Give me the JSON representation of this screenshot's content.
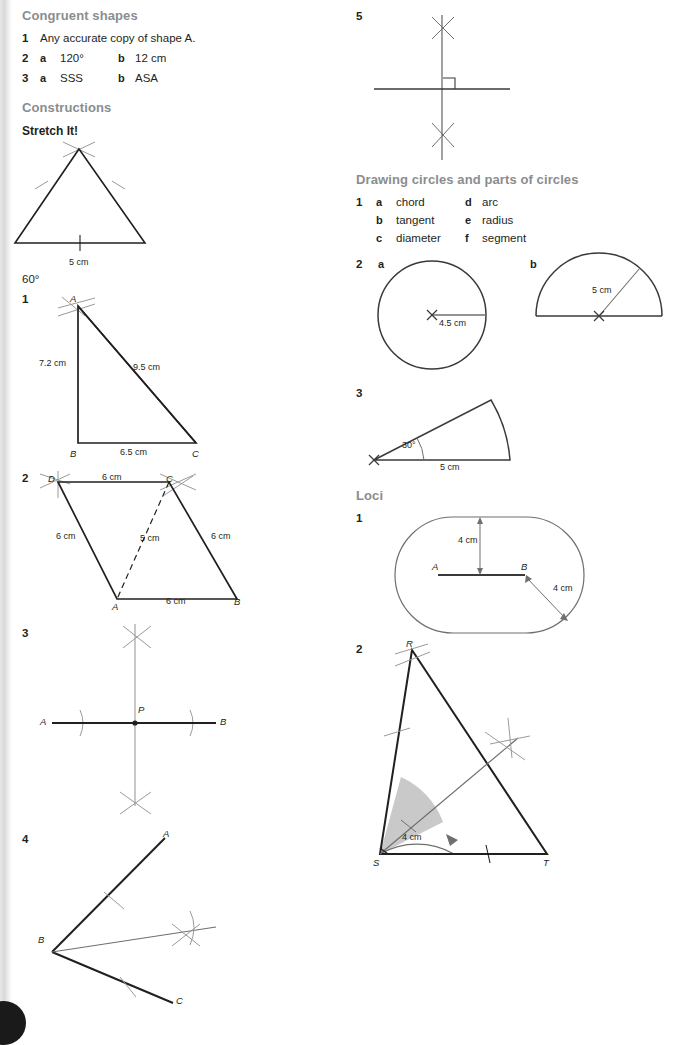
{
  "sections": {
    "congruent": {
      "heading": "Congruent shapes",
      "items": [
        {
          "n": "1",
          "text": "Any accurate copy of shape A."
        },
        {
          "n": "2",
          "a_label": "a",
          "a": "120°",
          "b_label": "b",
          "b": "12 cm"
        },
        {
          "n": "3",
          "a_label": "a",
          "a": "SSS",
          "b_label": "b",
          "b": "ASA"
        }
      ]
    },
    "constructions": {
      "heading": "Constructions",
      "stretch_it": "Stretch It!",
      "equilateral": {
        "base": "5 cm",
        "answer": "60°"
      },
      "q1": {
        "n": "1",
        "vertices": [
          "A",
          "B",
          "C"
        ],
        "ab": "7.2 cm",
        "ac": "9.5 cm",
        "bc": "6.5 cm"
      },
      "q2": {
        "n": "2",
        "vertices": [
          "D",
          "C",
          "A",
          "B"
        ],
        "dc": "6 cm",
        "da": "6 cm",
        "cb": "6 cm",
        "ab": "6 cm",
        "diag": "5 cm"
      },
      "q3": {
        "n": "3",
        "left": "A",
        "mid": "P",
        "right": "B"
      },
      "q4": {
        "n": "4",
        "a": "A",
        "b": "B",
        "c": "C"
      },
      "q5": {
        "n": "5"
      }
    },
    "circles": {
      "heading": "Drawing circles and parts of circles",
      "q1": {
        "n": "1",
        "left": [
          {
            "key": "a",
            "value": "chord"
          },
          {
            "key": "b",
            "value": "tangent"
          },
          {
            "key": "c",
            "value": "diameter"
          }
        ],
        "right": [
          {
            "key": "d",
            "value": "arc"
          },
          {
            "key": "e",
            "value": "radius"
          },
          {
            "key": "f",
            "value": "segment"
          }
        ]
      },
      "q2": {
        "n": "2",
        "a_label": "a",
        "a_dim": "4.5 cm",
        "b_label": "b",
        "b_dim": "5 cm"
      },
      "q3": {
        "n": "3",
        "angle": "30°",
        "radius": "5 cm"
      }
    },
    "loci": {
      "heading": "Loci",
      "q1": {
        "n": "1",
        "a": "A",
        "b": "B",
        "dim_top": "4 cm",
        "dim_right": "4 cm"
      },
      "q2": {
        "n": "2",
        "vertices": [
          "R",
          "S",
          "T"
        ],
        "radius": "4 cm"
      }
    }
  },
  "colors": {
    "heading_gray": "#8a8d90",
    "ink": "#231f20",
    "construction_gray": "#9a9a9a",
    "shade": "#c9c9c9"
  }
}
